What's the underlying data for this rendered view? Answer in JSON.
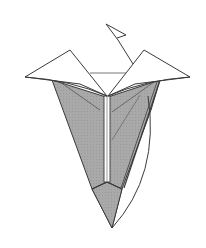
{
  "diagram": {
    "colors": {
      "background": "#ffffff",
      "paper_front": "#ffffff",
      "paper_back": "#a8a8a8",
      "line": "#3a3a3a"
    },
    "labels": []
  }
}
